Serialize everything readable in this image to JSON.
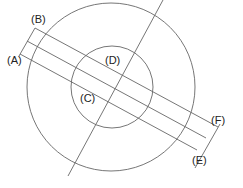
{
  "diagram": {
    "labels": {
      "A": "(A)",
      "B": "(B)",
      "C": "(C)",
      "D": "(D)",
      "E": "(E)",
      "F": "(F)"
    },
    "stroke_color": "#666666"
  }
}
